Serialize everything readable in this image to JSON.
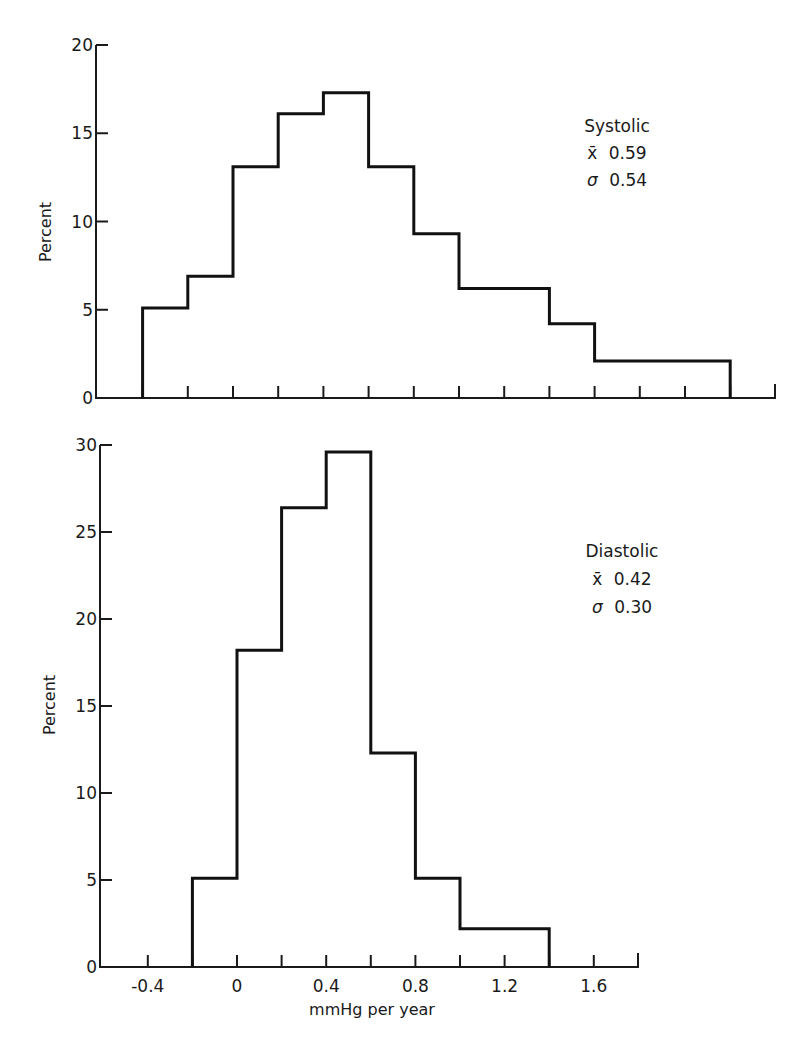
{
  "figure": {
    "background": "#ffffff",
    "ink_color": "#111111"
  },
  "chart_data": [
    {
      "type": "bar",
      "subtype": "histogram-step",
      "panel": "top",
      "title": "",
      "annotation": {
        "label": "Systolic",
        "mean_symbol": "x̄",
        "mean": "0.59",
        "sd_symbol": "σ",
        "sd": "0.54"
      },
      "xlabel": "",
      "ylabel": "Percent",
      "xlim": [
        -0.6,
        2.4
      ],
      "ylim": [
        0,
        20
      ],
      "yticks": [
        0,
        5,
        10,
        15,
        20
      ],
      "ytick_labels": [
        "0",
        "5",
        "10",
        "15",
        "20"
      ],
      "xticks": [
        -0.4,
        -0.2,
        0,
        0.2,
        0.4,
        0.6,
        0.8,
        1.0,
        1.2,
        1.4,
        1.6,
        1.8,
        2.0,
        2.2,
        2.4
      ],
      "xtick_labels": [],
      "grid": false,
      "bins": [
        {
          "from": -0.4,
          "to": -0.2,
          "value": 5.1
        },
        {
          "from": -0.2,
          "to": 0.0,
          "value": 6.9
        },
        {
          "from": 0.0,
          "to": 0.2,
          "value": 13.1
        },
        {
          "from": 0.2,
          "to": 0.4,
          "value": 16.1
        },
        {
          "from": 0.4,
          "to": 0.6,
          "value": 17.3
        },
        {
          "from": 0.6,
          "to": 0.8,
          "value": 13.1
        },
        {
          "from": 0.8,
          "to": 1.0,
          "value": 9.3
        },
        {
          "from": 1.0,
          "to": 1.2,
          "value": 6.2
        },
        {
          "from": 1.2,
          "to": 1.4,
          "value": 6.2
        },
        {
          "from": 1.4,
          "to": 1.6,
          "value": 4.2
        },
        {
          "from": 1.6,
          "to": 1.8,
          "value": 2.1
        },
        {
          "from": 1.8,
          "to": 2.0,
          "value": 2.1
        },
        {
          "from": 2.0,
          "to": 2.2,
          "value": 2.1
        }
      ],
      "categories": [
        "-0.4–-0.2",
        "-0.2–0",
        "0–0.2",
        "0.2–0.4",
        "0.4–0.6",
        "0.6–0.8",
        "0.8–1.0",
        "1.0–1.2",
        "1.2–1.4",
        "1.4–1.6",
        "1.6–1.8",
        "1.8–2.0",
        "2.0–2.2"
      ],
      "values": [
        5.1,
        6.9,
        13.1,
        16.1,
        17.3,
        13.1,
        9.3,
        6.2,
        6.2,
        4.2,
        2.1,
        2.1,
        2.1
      ]
    },
    {
      "type": "bar",
      "subtype": "histogram-step",
      "panel": "bottom",
      "title": "",
      "annotation": {
        "label": "Diastolic",
        "mean_symbol": "x̄",
        "mean": "0.42",
        "sd_symbol": "σ",
        "sd": "0.30"
      },
      "xlabel": "mmHg per year",
      "ylabel": "Percent",
      "xlim": [
        -0.6,
        1.8
      ],
      "ylim": [
        0,
        30
      ],
      "yticks": [
        0,
        5,
        10,
        15,
        20,
        25,
        30
      ],
      "ytick_labels": [
        "0",
        "5",
        "10",
        "15",
        "20",
        "25",
        "30"
      ],
      "xticks": [
        -0.4,
        -0.2,
        0,
        0.2,
        0.4,
        0.6,
        0.8,
        1.0,
        1.2,
        1.4,
        1.6,
        1.8
      ],
      "xtick_labels": [
        {
          "x": -0.4,
          "label": "-0.4"
        },
        {
          "x": 0,
          "label": "0"
        },
        {
          "x": 0.4,
          "label": "0.4"
        },
        {
          "x": 0.8,
          "label": "0.8"
        },
        {
          "x": 1.2,
          "label": "1.2"
        },
        {
          "x": 1.6,
          "label": "1.6"
        }
      ],
      "grid": false,
      "bins": [
        {
          "from": -0.2,
          "to": 0.0,
          "value": 5.1
        },
        {
          "from": 0.0,
          "to": 0.2,
          "value": 18.2
        },
        {
          "from": 0.2,
          "to": 0.4,
          "value": 26.4
        },
        {
          "from": 0.4,
          "to": 0.6,
          "value": 29.6
        },
        {
          "from": 0.6,
          "to": 0.8,
          "value": 12.3
        },
        {
          "from": 0.8,
          "to": 1.0,
          "value": 5.1
        },
        {
          "from": 1.0,
          "to": 1.2,
          "value": 2.2
        },
        {
          "from": 1.2,
          "to": 1.4,
          "value": 2.2
        }
      ],
      "categories": [
        "-0.2–0",
        "0–0.2",
        "0.2–0.4",
        "0.4–0.6",
        "0.6–0.8",
        "0.8–1.0",
        "1.0–1.2",
        "1.2–1.4"
      ],
      "values": [
        5.1,
        18.2,
        26.4,
        29.6,
        12.3,
        5.1,
        2.2,
        2.2
      ]
    }
  ],
  "layout": {
    "panels": [
      {
        "x0_px": 233,
        "px_per_unit": 226,
        "y0_px": 398,
        "px_per_pct": 17.65,
        "axis_left_px": 96,
        "axis_right_px": 775,
        "axis_top_px": 45,
        "annot_x": 617,
        "annot_y": [
          132,
          159,
          186
        ]
      },
      {
        "x0_px": 237,
        "px_per_unit": 223,
        "y0_px": 967,
        "px_per_pct": 17.4,
        "axis_left_px": 100,
        "axis_right_px": 638,
        "axis_top_px": 445,
        "annot_x": 622,
        "annot_y": [
          557,
          585,
          613
        ],
        "xlabel_x": 372,
        "xlabel_y": 1015,
        "xtick_label_y": 992
      }
    ]
  }
}
